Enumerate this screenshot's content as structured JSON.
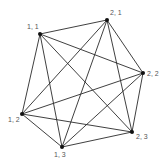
{
  "diagram": {
    "type": "complete-graph",
    "title": "",
    "colors": {
      "edge": "#2a2a2a",
      "node": "#111111",
      "label": "#555555",
      "background": "#ffffff"
    },
    "nodes": [
      {
        "id": "1,1",
        "label": "1, 1",
        "x": 40,
        "y": 34,
        "lx": 27,
        "ly": 29
      },
      {
        "id": "2,1",
        "label": "2, 1",
        "x": 107,
        "y": 20,
        "lx": 110,
        "ly": 15
      },
      {
        "id": "2,2",
        "label": "2, 2",
        "x": 143,
        "y": 73,
        "lx": 147,
        "ly": 76
      },
      {
        "id": "2,3",
        "label": "2, 3",
        "x": 132,
        "y": 132,
        "lx": 136,
        "ly": 139
      },
      {
        "id": "1,3",
        "label": "1, 3",
        "x": 62,
        "y": 147,
        "lx": 54,
        "ly": 157
      },
      {
        "id": "1,2",
        "label": "1, 2",
        "x": 22,
        "y": 114,
        "lx": 8,
        "ly": 122
      }
    ],
    "edges": [
      [
        "1,1",
        "2,1"
      ],
      [
        "1,1",
        "2,2"
      ],
      [
        "1,1",
        "2,3"
      ],
      [
        "1,1",
        "1,3"
      ],
      [
        "1,1",
        "1,2"
      ],
      [
        "2,1",
        "2,2"
      ],
      [
        "2,1",
        "2,3"
      ],
      [
        "2,1",
        "1,3"
      ],
      [
        "2,1",
        "1,2"
      ],
      [
        "2,2",
        "2,3"
      ],
      [
        "2,2",
        "1,3"
      ],
      [
        "2,2",
        "1,2"
      ],
      [
        "2,3",
        "1,3"
      ],
      [
        "2,3",
        "1,2"
      ],
      [
        "1,3",
        "1,2"
      ]
    ]
  }
}
